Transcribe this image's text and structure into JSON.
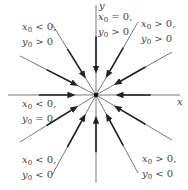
{
  "diagram": {
    "type": "phase-portrait",
    "center": {
      "x": 96,
      "y": 95
    },
    "axes": {
      "x_label": "x",
      "y_label": "y"
    },
    "colors": {
      "line": "#555555",
      "arrow": "#222222",
      "text": "#444444"
    },
    "rays": [
      {
        "name": "ray-up",
        "from": [
          96,
          5
        ],
        "to": [
          96,
          95
        ]
      },
      {
        "name": "ray-down",
        "from": [
          96,
          183
        ],
        "to": [
          96,
          95
        ]
      },
      {
        "name": "ray-left",
        "from": [
          8,
          95
        ],
        "to": [
          96,
          95
        ]
      },
      {
        "name": "ray-right",
        "from": [
          180,
          95
        ],
        "to": [
          96,
          95
        ]
      },
      {
        "name": "ray-upper-left-steep",
        "from": [
          52,
          24
        ],
        "to": [
          96,
          95
        ]
      },
      {
        "name": "ray-upper-left-shallow",
        "from": [
          20,
          56
        ],
        "to": [
          96,
          95
        ]
      },
      {
        "name": "ray-upper-right-steep",
        "from": [
          138,
          22
        ],
        "to": [
          96,
          95
        ]
      },
      {
        "name": "ray-upper-right-shallow",
        "from": [
          172,
          52
        ],
        "to": [
          96,
          95
        ]
      },
      {
        "name": "ray-lower-left-shallow",
        "from": [
          20,
          142
        ],
        "to": [
          96,
          95
        ]
      },
      {
        "name": "ray-lower-left-steep",
        "from": [
          52,
          175
        ],
        "to": [
          96,
          95
        ]
      },
      {
        "name": "ray-lower-right-shallow",
        "from": [
          172,
          140
        ],
        "to": [
          96,
          95
        ]
      },
      {
        "name": "ray-lower-right-steep",
        "from": [
          138,
          173
        ],
        "to": [
          96,
          95
        ]
      }
    ],
    "region_labels": [
      {
        "name": "label-xneg-ypos",
        "line1": {
          "v": "x",
          "s": "0",
          "r": " < 0,"
        },
        "line2": {
          "v": "y",
          "s": "0",
          "r": " > 0"
        }
      },
      {
        "name": "label-xzero-ypos",
        "line1": {
          "v": "x",
          "s": "0",
          "r": " = 0,"
        },
        "line2": {
          "v": "y",
          "s": "0",
          "r": " > 0"
        }
      },
      {
        "name": "label-xpos-ypos",
        "line1": {
          "v": "x",
          "s": "0",
          "r": " > 0,"
        },
        "line2": {
          "v": "y",
          "s": "0",
          "r": " > 0"
        }
      },
      {
        "name": "label-xneg-yzero",
        "line1": {
          "v": "x",
          "s": "0",
          "r": " < 0,"
        },
        "line2": {
          "v": "y",
          "s": "0",
          "r": " = 0"
        }
      },
      {
        "name": "label-xneg-yneg",
        "line1": {
          "v": "x",
          "s": "0",
          "r": " < 0,"
        },
        "line2": {
          "v": "y",
          "s": "0",
          "r": " < 0"
        }
      },
      {
        "name": "label-xpos-yneg",
        "line1": {
          "v": "x",
          "s": "0",
          "r": " > 0,"
        },
        "line2": {
          "v": "y",
          "s": "0",
          "r": " < 0"
        }
      }
    ]
  }
}
